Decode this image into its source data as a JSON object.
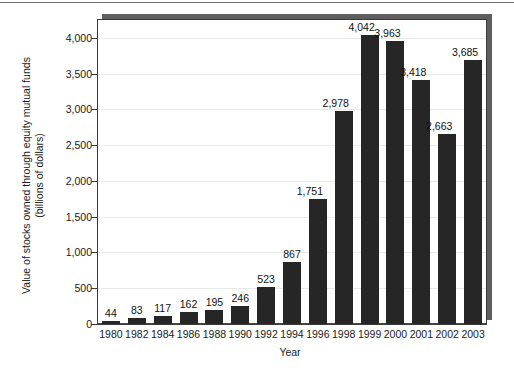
{
  "chart_data": {
    "type": "bar",
    "title": "",
    "xlabel": "Year",
    "ylabel": "Value of stocks owned through equity mutual funds (billions of dollars)",
    "ylabel_lines": [
      "Value of stocks owned through equity mutual funds",
      "(billions of dollars)"
    ],
    "categories": [
      "1980",
      "1982",
      "1984",
      "1986",
      "1988",
      "1990",
      "1992",
      "1994",
      "1996",
      "1998",
      "1999",
      "2000",
      "2001",
      "2002",
      "2003"
    ],
    "values": [
      44,
      83,
      117,
      162,
      195,
      246,
      523,
      867,
      1751,
      2978,
      4042,
      3963,
      3418,
      2663,
      3685
    ],
    "value_labels": [
      "44",
      "83",
      "117",
      "162",
      "195",
      "246",
      "523",
      "867",
      "1,751",
      "2,978",
      "4,042",
      "3,963",
      "3,418",
      "2,663",
      "3,685"
    ],
    "ylim": [
      0,
      4250
    ],
    "yticks": [
      0,
      500,
      1000,
      1500,
      2000,
      2500,
      3000,
      3500,
      4000
    ],
    "ytick_labels": [
      "0",
      "500",
      "1,000",
      "1,500",
      "2,000",
      "2,500",
      "3,000",
      "3,500",
      "4,000"
    ],
    "grid": true,
    "legend": "none",
    "bar_color": "#262626",
    "gridline_color": "#e9e9e9",
    "axis_color": "#3a3a3a",
    "shadow_color": "#5e5e5e",
    "background_color": "#ffffff"
  }
}
